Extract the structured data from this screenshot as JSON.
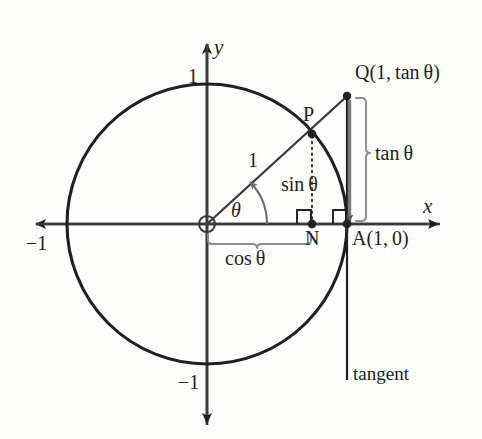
{
  "figure": {
    "background_color": "#fdfdfc",
    "stroke_color": "#231f20",
    "brace_color": "#8c8c8c",
    "tangent_segment_color": "#7a7a7a"
  },
  "axes": {
    "x_label": "x",
    "y_label": "y",
    "x_tick_negative": "−1",
    "y_tick_positive": "1",
    "y_tick_negative": "−1"
  },
  "points": {
    "origin_label": "O",
    "p_label": "P",
    "n_label": "N",
    "a_label": "A(1, 0)",
    "q_label": "Q(1, tan θ)"
  },
  "segments": {
    "radius_label": "1",
    "sin_label": "sin θ",
    "cos_label": "cos θ",
    "tan_label": "tan θ",
    "angle_label": "θ",
    "tangent_line_label": "tangent"
  },
  "geometry": {
    "origin": [
      207,
      224
    ],
    "radius_px": 140,
    "point_p": [
      312,
      134
    ],
    "point_n": [
      312,
      224
    ],
    "point_a": [
      347,
      224
    ],
    "point_q": [
      347,
      96
    ],
    "angle_degrees": 40
  }
}
